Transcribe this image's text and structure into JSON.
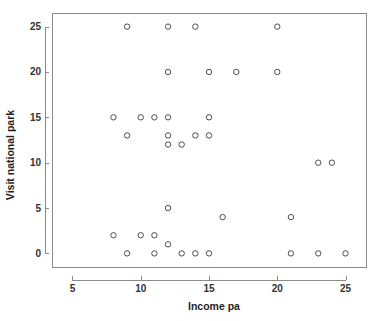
{
  "chart_data": {
    "type": "scatter",
    "title": "",
    "xlabel": "Income pa",
    "ylabel": "Visit national park",
    "xlim": [
      3.5,
      26.5
    ],
    "ylim": [
      -1.5,
      26.5
    ],
    "xticks": [
      5,
      10,
      15,
      20,
      25
    ],
    "xtick_labels": [
      "5",
      "10",
      "15",
      "20",
      "25"
    ],
    "yticks": [
      0,
      5,
      10,
      15,
      20,
      25
    ],
    "ytick_labels": [
      "0",
      "5",
      "10",
      "15",
      "20",
      "25"
    ],
    "grid": false,
    "legend": null,
    "marker": "open-circle",
    "marker_color": "#4d4d4d",
    "points": [
      {
        "x": 9,
        "y": 25
      },
      {
        "x": 12,
        "y": 25
      },
      {
        "x": 14,
        "y": 25
      },
      {
        "x": 20,
        "y": 25
      },
      {
        "x": 12,
        "y": 20
      },
      {
        "x": 15,
        "y": 20
      },
      {
        "x": 17,
        "y": 20
      },
      {
        "x": 20,
        "y": 20
      },
      {
        "x": 8,
        "y": 15
      },
      {
        "x": 10,
        "y": 15
      },
      {
        "x": 11,
        "y": 15
      },
      {
        "x": 12,
        "y": 15
      },
      {
        "x": 15,
        "y": 15
      },
      {
        "x": 9,
        "y": 13
      },
      {
        "x": 12,
        "y": 13
      },
      {
        "x": 14,
        "y": 13
      },
      {
        "x": 15,
        "y": 13
      },
      {
        "x": 12,
        "y": 12
      },
      {
        "x": 13,
        "y": 12
      },
      {
        "x": 23,
        "y": 10
      },
      {
        "x": 24,
        "y": 10
      },
      {
        "x": 12,
        "y": 5
      },
      {
        "x": 16,
        "y": 4
      },
      {
        "x": 21,
        "y": 4
      },
      {
        "x": 8,
        "y": 2
      },
      {
        "x": 10,
        "y": 2
      },
      {
        "x": 11,
        "y": 2
      },
      {
        "x": 12,
        "y": 1
      },
      {
        "x": 9,
        "y": 0
      },
      {
        "x": 11,
        "y": 0
      },
      {
        "x": 13,
        "y": 0
      },
      {
        "x": 14,
        "y": 0
      },
      {
        "x": 15,
        "y": 0
      },
      {
        "x": 21,
        "y": 0
      },
      {
        "x": 23,
        "y": 0
      },
      {
        "x": 25,
        "y": 0
      }
    ]
  }
}
